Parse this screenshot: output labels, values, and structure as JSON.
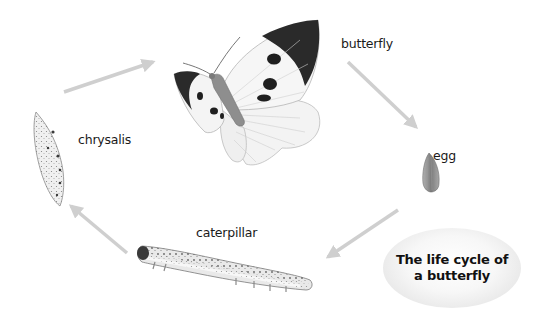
{
  "diagram": {
    "title_lines": [
      "The life cycle of",
      "a butterfly"
    ],
    "stages": [
      {
        "id": "butterfly",
        "label": "butterfly"
      },
      {
        "id": "egg",
        "label": "egg"
      },
      {
        "id": "caterpillar",
        "label": "caterpillar"
      },
      {
        "id": "chrysalis",
        "label": "chrysalis"
      }
    ],
    "arrows": [
      {
        "from": "chrysalis",
        "to": "butterfly"
      },
      {
        "from": "butterfly",
        "to": "egg"
      },
      {
        "from": "egg",
        "to": "caterpillar"
      },
      {
        "from": "caterpillar",
        "to": "chrysalis"
      }
    ],
    "colors": {
      "arrow": "#cfcfcf",
      "wing_black": "#2a2a2a",
      "wing_white": "#f4f4f4",
      "body": "#8e8e8e",
      "egg": "#8a8a8a",
      "oval_bg": "#ececec"
    }
  }
}
